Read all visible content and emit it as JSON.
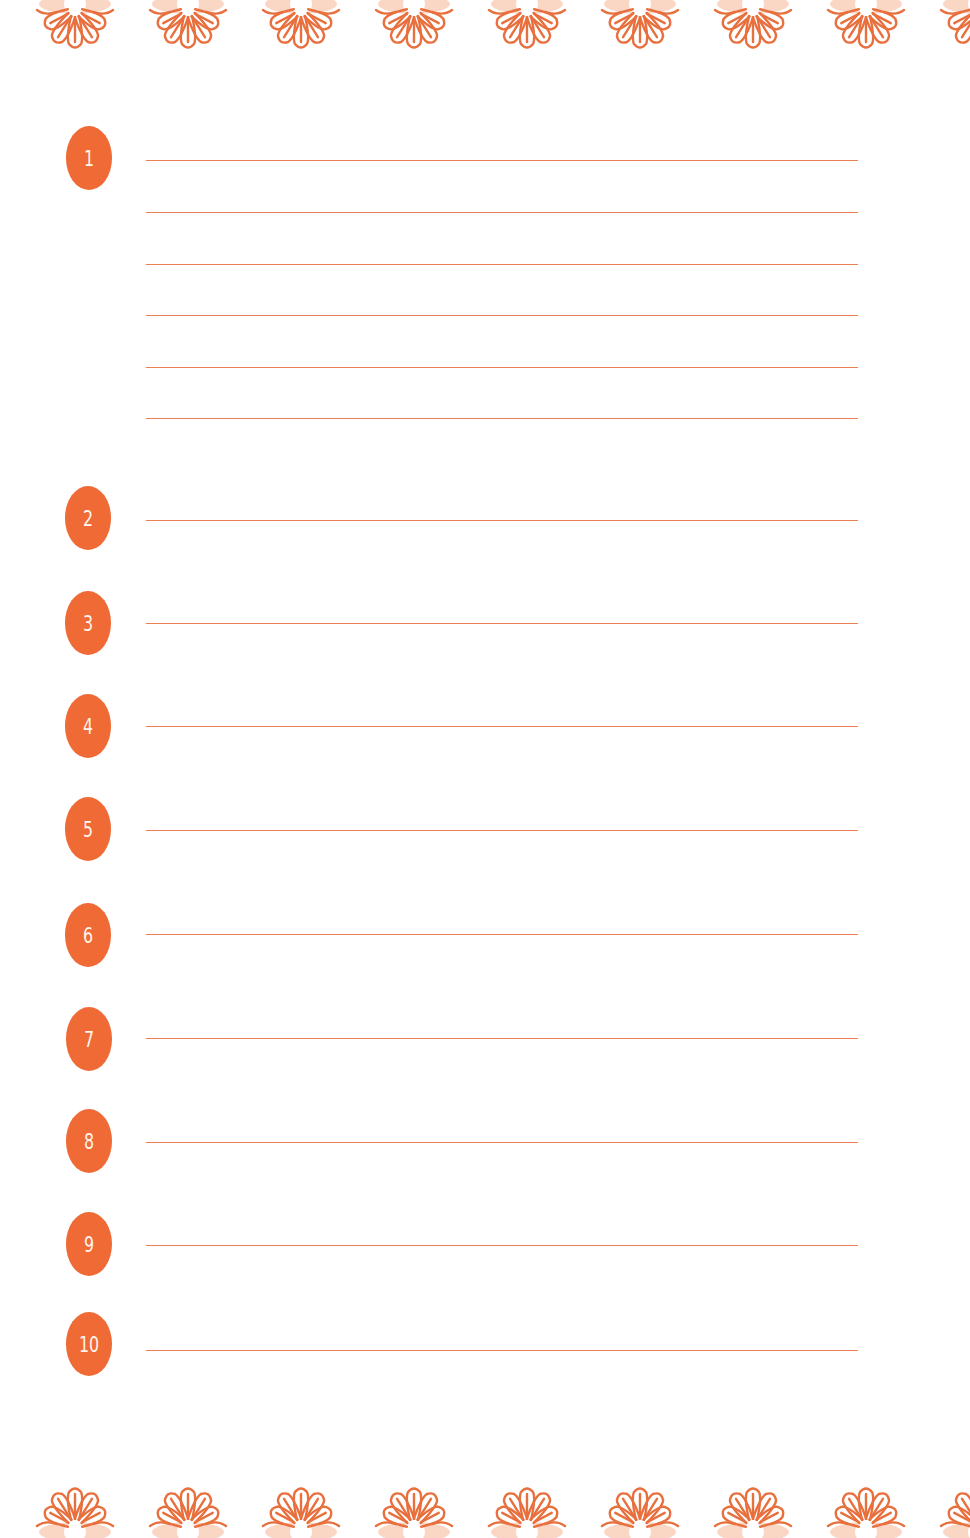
{
  "page": {
    "background": "#ffffff",
    "accent_color": "#ef6a35",
    "line_color": "#e97e58"
  },
  "decoration": {
    "top_border_icon": "flower-icon",
    "bottom_border_icon": "flower-icon",
    "flower_count_top": 9,
    "flower_count_bottom": 9
  },
  "list": {
    "items": [
      {
        "number": "1",
        "lines": 6
      },
      {
        "number": "2",
        "lines": 1
      },
      {
        "number": "3",
        "lines": 1
      },
      {
        "number": "4",
        "lines": 1
      },
      {
        "number": "5",
        "lines": 1
      },
      {
        "number": "6",
        "lines": 1
      },
      {
        "number": "7",
        "lines": 1
      },
      {
        "number": "8",
        "lines": 1
      },
      {
        "number": "9",
        "lines": 1
      },
      {
        "number": "10",
        "lines": 1
      }
    ]
  }
}
